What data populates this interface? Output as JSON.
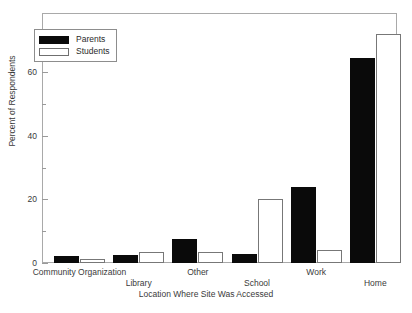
{
  "chart_data": {
    "type": "bar",
    "title": "",
    "xlabel": "Location Where Site Was Accessed",
    "ylabel": "Percent of Respondents",
    "categories": [
      "Community Organization",
      "Library",
      "Other",
      "School",
      "Work",
      "Home"
    ],
    "series": [
      {
        "name": "Parents",
        "values": [
          2.3,
          2.5,
          7.5,
          2.8,
          24.0,
          64.5
        ],
        "color": "#0a0a0a"
      },
      {
        "name": "Students",
        "values": [
          1.2,
          3.5,
          3.6,
          20.0,
          4.0,
          72.0
        ],
        "color": "#ffffff"
      }
    ],
    "ylim": [
      0,
      78.6
    ],
    "yticks": [
      0,
      20,
      40,
      60
    ],
    "yticks_minor": [
      10,
      30,
      50,
      70
    ],
    "grid": false,
    "legend_position": "top-left",
    "legend_entries": [
      "Parents",
      "Students"
    ]
  },
  "axes": {
    "y_tick_labels": [
      "0",
      "20",
      "40",
      "60"
    ],
    "y_axis_title": "Percent of Respondents",
    "x_axis_title": "Location Where Site Was Accessed",
    "x_tick_labels_row_top": [
      "Community Organization",
      "Other",
      "Work"
    ],
    "x_tick_labels_row_bottom": [
      "Library",
      "School",
      "Home"
    ]
  },
  "legend": {
    "items": [
      {
        "label": "Parents",
        "swatch": "filled-black-swatch"
      },
      {
        "label": "Students",
        "swatch": "empty-white-swatch"
      }
    ]
  },
  "colors": {
    "parents": "#0a0a0a",
    "students": "#ffffff",
    "frame": "#a9a9a9",
    "text": "#3a3a3a",
    "background": "#ffffff"
  }
}
